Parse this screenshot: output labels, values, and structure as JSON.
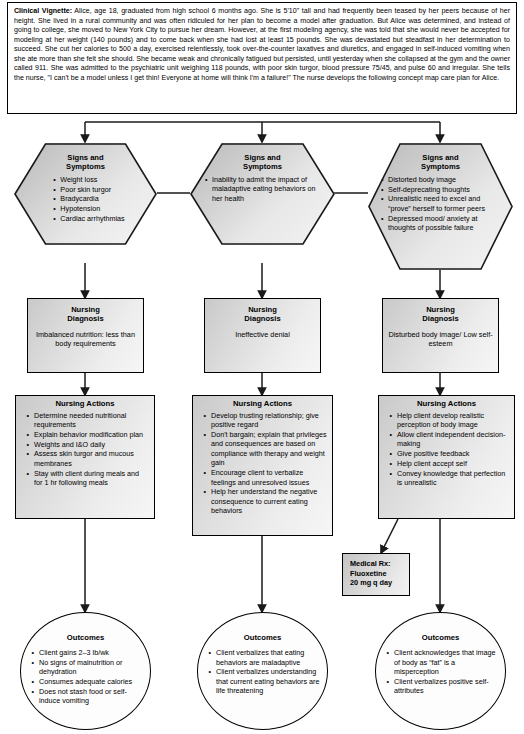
{
  "vignette": {
    "label": "Clinical Vignette:",
    "text": " Alice, age 18, graduated from high school 6 months ago. She is 5'10\" tall and had frequently been teased by her peers because of her height. She lived in a rural community and was often ridiculed for her plan to become a model after graduation. But Alice was determined, and instead of going to college, she moved to New York City to pursue her dream. However, at the first modeling agency, she was told that she would never be accepted for modeling at her weight (140 pounds) and to come back when she had lost at least 15 pounds. She was devastated but steadfast in her determination to succeed. She cut her calories to 500 a day, exercised relentlessly, took over-the-counter laxatives and diuretics, and engaged in self-induced vomiting when she ate more than she felt she should. She became weak and chronically fatigued but persisted, until yesterday when she collapsed at the gym and the owner called 911. She was admitted to the psychiatric unit weighing 118 pounds, with poor skin turgor, blood pressure 75/45, and pulse 60 and irregular. She tells the nurse, \"I can't be a model unless I get thin! Everyone at home will think I'm a failure!\" The nurse develops the following concept map care plan for Alice."
  },
  "columns": [
    {
      "signs": {
        "title": "Signs and\nSymptoms",
        "items": [
          "Weight loss",
          "Poor skin turgor",
          "Bradycardia",
          "Hypotension",
          "Cardiac arrhythmias"
        ]
      },
      "diagnosis": {
        "title": "Nursing\nDiagnosis",
        "text": "Imbalanced nutrition: less than body requirements"
      },
      "actions": {
        "title": "Nursing Actions",
        "items": [
          "Determine needed nutritional requirements",
          "Explain behavior modification plan",
          "Weights and I&O daily",
          "Assess skin turgor and mucous membranes",
          "Stay with client during meals and for 1 hr following meals"
        ]
      },
      "outcomes": {
        "title": "Outcomes",
        "items": [
          "Client gains 2–3 lb/wk",
          "No signs of malnutrition or dehydration",
          "Consumes adequate calories",
          "Does not stash food or self-induce vomiting"
        ]
      }
    },
    {
      "signs": {
        "title": "Signs and\nSymptoms",
        "items": [
          "Inability to admit the impact of maladaptive eating behaviors on her health"
        ]
      },
      "diagnosis": {
        "title": "Nursing\nDiagnosis",
        "text": "Ineffective denial"
      },
      "actions": {
        "title": "Nursing Actions",
        "items": [
          "Develop trusting relationship; give positive regard",
          "Don't bargain; explain that privileges and consequences are based on compliance with therapy and weight gain",
          "Encourage client to verbalize feelings and unresolved issues",
          "Help her understand the negative consequence to current eating behaviors"
        ]
      },
      "outcomes": {
        "title": "Outcomes",
        "items": [
          "Client verbalizes that eating behaviors are maladaptive",
          "Client verbalizes understanding that current eating behaviors are life threatening"
        ]
      }
    },
    {
      "signs": {
        "title": "Signs and\nSymptoms",
        "items": [
          "Distorted body image",
          "Self-deprecating thoughts",
          "Unrealistic need to excel and “prove” herself to former peers",
          "Depressed mood/ anxiety at thoughts of possible failure"
        ]
      },
      "diagnosis": {
        "title": "Nursing\nDiagnosis",
        "text": "Disturbed body image/ Low self-esteem"
      },
      "actions": {
        "title": "Nursing Actions",
        "items": [
          "Help client develop realistic perception of body image",
          "Allow client independent decision-making",
          "Give positive feedback",
          "Help client accept self",
          "Convey knowledge that perfection is unrealistic"
        ]
      },
      "outcomes": {
        "title": "Outcomes",
        "items": [
          "Client acknowledges that image of body as “fat” is a misperception",
          "Client verbalizes positive self-attributes"
        ]
      }
    }
  ],
  "medical_rx": {
    "line1": "Medical Rx:",
    "line2": "Fluoxetine",
    "line3": "20 mg q day"
  },
  "colors": {
    "stroke": "#1a1a1a",
    "box_fill_light": "#ededed",
    "box_fill_dark": "#c9c9c9",
    "page_bg": "#ffffff"
  }
}
